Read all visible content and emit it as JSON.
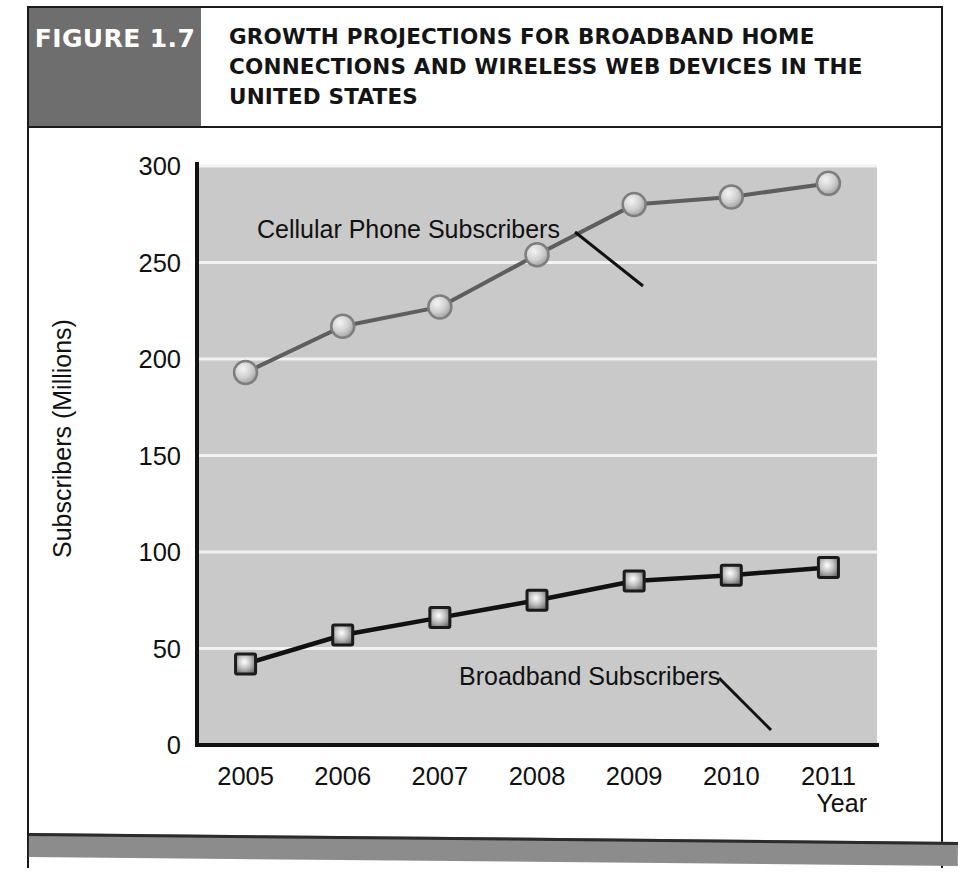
{
  "figure": {
    "tag": "FIGURE 1.7",
    "title": "GROWTH PROJECTIONS FOR BROADBAND HOME CONNECTIONS AND WIRELESS WEB DEVICES IN THE UNITED STATES"
  },
  "colors": {
    "tag_background": "#6e6e6e",
    "plot_background": "#c9c9c9",
    "gridline": "#f2f2f2",
    "axis": "#111111",
    "cellular_line": "#5e5e5e",
    "cellular_marker": "#bdbdbd",
    "broadband_line": "#111111",
    "broadband_marker": "#9a9a9a",
    "footer_bar": "#8c8c8c",
    "text": "#111111"
  },
  "chart_data": {
    "type": "line",
    "title": "GROWTH PROJECTIONS FOR BROADBAND HOME CONNECTIONS AND WIRELESS WEB DEVICES IN THE UNITED STATES",
    "xlabel": "Year",
    "ylabel": "Subscribers (Millions)",
    "categories": [
      "2005",
      "2006",
      "2007",
      "2008",
      "2009",
      "2010",
      "2011"
    ],
    "x": [
      2005,
      2006,
      2007,
      2008,
      2009,
      2010,
      2011
    ],
    "xticklabels": [
      "2005",
      "2006",
      "2007",
      "2008",
      "2009",
      "2010",
      "2011"
    ],
    "yticks": [
      0,
      50,
      100,
      150,
      200,
      250,
      300
    ],
    "yticklabels": [
      "0",
      "50",
      "100",
      "150",
      "200",
      "250",
      "300"
    ],
    "ylim": [
      0,
      300
    ],
    "grid": "horizontal",
    "legend": "inline-annotations",
    "series": [
      {
        "name": "Cellular Phone Subscribers",
        "marker": "circle",
        "values": [
          193,
          217,
          227,
          254,
          280,
          284,
          291
        ]
      },
      {
        "name": "Broadband Subscribers",
        "marker": "square",
        "values": [
          42,
          57,
          66,
          75,
          85,
          88,
          92
        ]
      }
    ],
    "annotations": [
      {
        "text": "Cellular Phone Subscribers",
        "target_series": "Cellular Phone Subscribers",
        "target_x": 2008
      },
      {
        "text": "Broadband Subscribers",
        "target_series": "Broadband Subscribers",
        "target_x": 2009
      }
    ]
  }
}
